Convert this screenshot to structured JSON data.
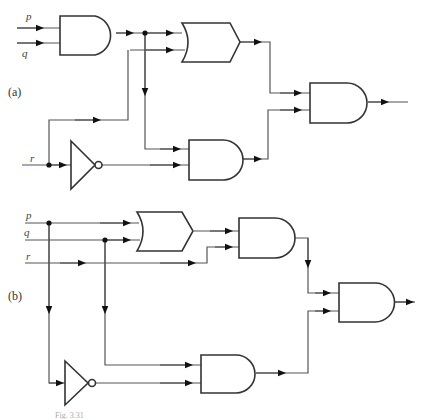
{
  "diagram": {
    "type": "logic-circuit",
    "panels": [
      {
        "id": "a",
        "label": "(a)",
        "inputs": [
          "p",
          "q",
          "r"
        ],
        "gates": [
          "AND(p,q)",
          "OR(AND(p,q), r)",
          "NOT(r)",
          "AND(AND(p,q), NOT r)",
          "AND(OR, AND)"
        ]
      },
      {
        "id": "b",
        "label": "(b)",
        "inputs": [
          "p",
          "q",
          "r"
        ],
        "gates": [
          "OR(p,q)",
          "AND(OR(p,q), r)",
          "NOT(p)",
          "AND(q, NOT p)",
          "AND(AND, AND)"
        ]
      }
    ],
    "caption": "Fig. 3.31"
  },
  "labels": {
    "a_p": "p",
    "a_q": "q",
    "a_r": "r",
    "a_panel": "(a)",
    "b_p": "p",
    "b_q": "q",
    "b_r": "r",
    "b_panel": "(b)",
    "caption": "Fig. 3.31"
  }
}
